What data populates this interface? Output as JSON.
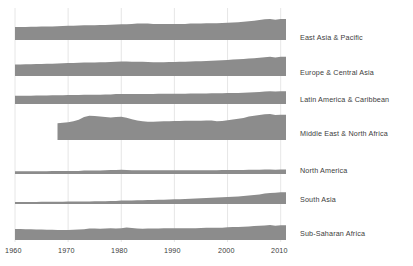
{
  "chart_data": {
    "type": "area",
    "title": "",
    "subtitle": "",
    "xlabel": "",
    "ylabel": "",
    "grid": true,
    "legend_position": "right",
    "xlim": [
      1960,
      2011
    ],
    "xticks": [
      1960,
      1970,
      1980,
      1990,
      2000,
      2010
    ],
    "xtick_labels": [
      "1960",
      "1970",
      "1980",
      "1990",
      "2000",
      "2010"
    ],
    "x": [
      1960,
      1961,
      1962,
      1963,
      1964,
      1965,
      1966,
      1967,
      1968,
      1969,
      1970,
      1971,
      1972,
      1973,
      1974,
      1975,
      1976,
      1977,
      1978,
      1979,
      1980,
      1981,
      1982,
      1983,
      1984,
      1985,
      1986,
      1987,
      1988,
      1989,
      1990,
      1991,
      1992,
      1993,
      1994,
      1995,
      1996,
      1997,
      1998,
      1999,
      2000,
      2001,
      2002,
      2003,
      2004,
      2005,
      2006,
      2007,
      2008,
      2009,
      2010,
      2011
    ],
    "panel_height_units": 1.0,
    "series": [
      {
        "name": "East Asia & Pacific",
        "values": [
          0.5,
          0.5,
          0.5,
          0.51,
          0.51,
          0.52,
          0.52,
          0.52,
          0.53,
          0.54,
          0.55,
          0.55,
          0.56,
          0.57,
          0.57,
          0.57,
          0.58,
          0.58,
          0.59,
          0.6,
          0.61,
          0.61,
          0.62,
          0.63,
          0.63,
          0.63,
          0.62,
          0.62,
          0.62,
          0.62,
          0.62,
          0.62,
          0.62,
          0.63,
          0.63,
          0.63,
          0.64,
          0.64,
          0.64,
          0.65,
          0.66,
          0.67,
          0.68,
          0.7,
          0.72,
          0.74,
          0.77,
          0.8,
          0.81,
          0.78,
          0.81,
          0.81
        ]
      },
      {
        "name": "Europe & Central Asia",
        "values": [
          0.44,
          0.44,
          0.45,
          0.45,
          0.46,
          0.46,
          0.47,
          0.47,
          0.48,
          0.49,
          0.5,
          0.5,
          0.51,
          0.52,
          0.52,
          0.52,
          0.53,
          0.53,
          0.54,
          0.55,
          0.56,
          0.56,
          0.55,
          0.55,
          0.55,
          0.54,
          0.53,
          0.53,
          0.53,
          0.54,
          0.54,
          0.55,
          0.55,
          0.56,
          0.57,
          0.57,
          0.58,
          0.59,
          0.6,
          0.61,
          0.62,
          0.63,
          0.64,
          0.65,
          0.67,
          0.68,
          0.7,
          0.72,
          0.74,
          0.71,
          0.74,
          0.74
        ]
      },
      {
        "name": "Latin America & Caribbean",
        "values": [
          0.32,
          0.32,
          0.32,
          0.32,
          0.33,
          0.33,
          0.33,
          0.34,
          0.34,
          0.34,
          0.35,
          0.35,
          0.35,
          0.36,
          0.36,
          0.36,
          0.36,
          0.37,
          0.37,
          0.38,
          0.38,
          0.38,
          0.38,
          0.38,
          0.38,
          0.38,
          0.38,
          0.39,
          0.39,
          0.39,
          0.39,
          0.39,
          0.39,
          0.4,
          0.4,
          0.4,
          0.4,
          0.41,
          0.41,
          0.41,
          0.42,
          0.42,
          0.42,
          0.43,
          0.44,
          0.45,
          0.46,
          0.48,
          0.49,
          0.48,
          0.49,
          0.49
        ]
      },
      {
        "name": "Middle East & North Africa",
        "values": [
          null,
          null,
          null,
          null,
          null,
          null,
          null,
          null,
          0.64,
          0.66,
          0.68,
          0.72,
          0.78,
          0.88,
          0.93,
          0.92,
          0.9,
          0.88,
          0.87,
          0.88,
          0.89,
          0.86,
          0.8,
          0.75,
          0.72,
          0.7,
          0.7,
          0.71,
          0.72,
          0.72,
          0.73,
          0.73,
          0.74,
          0.74,
          0.74,
          0.74,
          0.75,
          0.75,
          0.72,
          0.73,
          0.76,
          0.79,
          0.82,
          0.85,
          0.9,
          0.93,
          0.96,
          0.99,
          1.0,
          0.96,
          0.97,
          0.97
        ]
      },
      {
        "name": "North America",
        "values": [
          0.11,
          0.11,
          0.11,
          0.11,
          0.11,
          0.11,
          0.11,
          0.12,
          0.12,
          0.12,
          0.12,
          0.12,
          0.12,
          0.13,
          0.13,
          0.13,
          0.13,
          0.14,
          0.15,
          0.15,
          0.16,
          0.15,
          0.14,
          0.14,
          0.14,
          0.14,
          0.14,
          0.14,
          0.14,
          0.14,
          0.14,
          0.14,
          0.14,
          0.14,
          0.14,
          0.14,
          0.14,
          0.14,
          0.14,
          0.15,
          0.15,
          0.15,
          0.15,
          0.15,
          0.16,
          0.16,
          0.16,
          0.17,
          0.17,
          0.16,
          0.17,
          0.17
        ]
      },
      {
        "name": "South Asia",
        "values": [
          0.08,
          0.08,
          0.08,
          0.08,
          0.08,
          0.09,
          0.09,
          0.09,
          0.09,
          0.09,
          0.1,
          0.1,
          0.1,
          0.1,
          0.1,
          0.11,
          0.11,
          0.11,
          0.12,
          0.12,
          0.13,
          0.13,
          0.13,
          0.14,
          0.14,
          0.15,
          0.15,
          0.16,
          0.16,
          0.17,
          0.18,
          0.18,
          0.19,
          0.2,
          0.21,
          0.22,
          0.23,
          0.24,
          0.25,
          0.26,
          0.27,
          0.28,
          0.29,
          0.31,
          0.33,
          0.35,
          0.37,
          0.4,
          0.42,
          0.43,
          0.45,
          0.45
        ]
      },
      {
        "name": "Sub-Saharan Africa",
        "values": [
          0.42,
          0.42,
          0.41,
          0.41,
          0.4,
          0.4,
          0.39,
          0.39,
          0.38,
          0.38,
          0.38,
          0.39,
          0.4,
          0.41,
          0.44,
          0.44,
          0.43,
          0.44,
          0.45,
          0.44,
          0.45,
          0.48,
          0.46,
          0.44,
          0.43,
          0.44,
          0.44,
          0.44,
          0.45,
          0.45,
          0.45,
          0.45,
          0.45,
          0.45,
          0.45,
          0.46,
          0.47,
          0.47,
          0.47,
          0.47,
          0.49,
          0.5,
          0.5,
          0.51,
          0.52,
          0.54,
          0.55,
          0.56,
          0.58,
          0.55,
          0.57,
          0.57
        ]
      }
    ]
  },
  "style": {
    "area_fill": "#8c8c8c",
    "gridline_color": "#e0e0e0",
    "text_color": "#3c3c3c",
    "background": "#ffffff"
  },
  "labels": {
    "series_0": "East Asia & Pacific",
    "series_1": "Europe & Central Asia",
    "series_2": "Latin America & Caribbean",
    "series_3": "Middle East & North Africa",
    "series_4": "North America",
    "series_5": "South Asia",
    "series_6": "Sub-Saharan Africa"
  },
  "axis": {
    "tick_0": "1960",
    "tick_1": "1970",
    "tick_2": "1980",
    "tick_3": "1990",
    "tick_4": "2000",
    "tick_5": "2010"
  }
}
